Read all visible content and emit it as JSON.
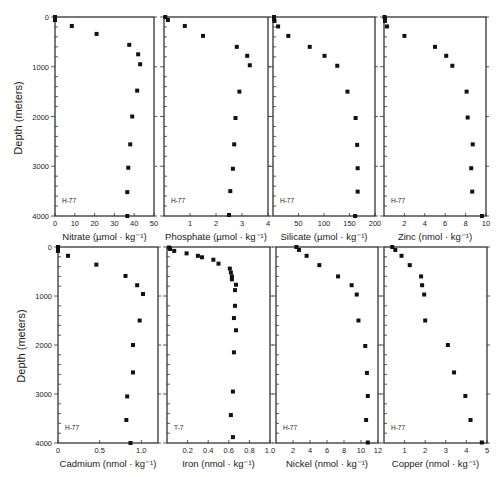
{
  "figure": {
    "ylabel": "Depth (meters)",
    "y_ticks": [
      0,
      1000,
      2000,
      3000,
      4000
    ],
    "y_tick_labels": [
      "0",
      "1000",
      "2000",
      "3000",
      "4000"
    ]
  },
  "chart_data": [
    {
      "type": "scatter",
      "title": "",
      "xlabel": "Nitrate (µmol · kg⁻¹)",
      "ylabel": "Depth (meters)",
      "station": "H-77",
      "xlim": [
        0,
        50
      ],
      "ylim": [
        4000,
        0
      ],
      "x_ticks": [
        0,
        10,
        20,
        30,
        40,
        50
      ],
      "x_tick_labels": [
        "0",
        "10",
        "20",
        "30",
        "40",
        "50"
      ],
      "points": [
        [
          0,
          0
        ],
        [
          0,
          30
        ],
        [
          0,
          60
        ],
        [
          8.5,
          180
        ],
        [
          21,
          340
        ],
        [
          37.5,
          560
        ],
        [
          42,
          750
        ],
        [
          43,
          950
        ],
        [
          41.5,
          1480
        ],
        [
          39,
          2000
        ],
        [
          38,
          2560
        ],
        [
          37,
          3030
        ],
        [
          36.5,
          3520
        ],
        [
          36.5,
          4000
        ]
      ]
    },
    {
      "type": "scatter",
      "title": "",
      "xlabel": "Phosphate (µmol · kg⁻¹)",
      "ylabel": "Depth (meters)",
      "station": "H-77",
      "xlim": [
        0,
        4
      ],
      "ylim": [
        4000,
        0
      ],
      "x_ticks": [
        1,
        2,
        3,
        4
      ],
      "x_tick_labels": [
        "1",
        "2",
        "3",
        "4"
      ],
      "points": [
        [
          0.05,
          0
        ],
        [
          0.15,
          60
        ],
        [
          0.8,
          180
        ],
        [
          1.5,
          380
        ],
        [
          2.8,
          600
        ],
        [
          3.2,
          780
        ],
        [
          3.3,
          970
        ],
        [
          2.9,
          1500
        ],
        [
          2.75,
          2030
        ],
        [
          2.7,
          2560
        ],
        [
          2.65,
          3050
        ],
        [
          2.55,
          3500
        ],
        [
          2.5,
          3980
        ]
      ]
    },
    {
      "type": "scatter",
      "title": "",
      "xlabel": "Silicate (µmol · kg⁻¹)",
      "ylabel": "Depth (meters)",
      "station": "H-77",
      "xlim": [
        0,
        200
      ],
      "ylim": [
        4000,
        0
      ],
      "x_ticks": [
        50,
        100,
        150,
        200
      ],
      "x_tick_labels": [
        "50",
        "100",
        "150",
        "200"
      ],
      "points": [
        [
          2,
          0
        ],
        [
          2,
          40
        ],
        [
          3,
          80
        ],
        [
          10,
          190
        ],
        [
          30,
          380
        ],
        [
          72,
          600
        ],
        [
          101,
          780
        ],
        [
          126,
          980
        ],
        [
          146,
          1500
        ],
        [
          162,
          2030
        ],
        [
          165,
          2570
        ],
        [
          166,
          3040
        ],
        [
          166,
          3510
        ],
        [
          161,
          4000
        ]
      ]
    },
    {
      "type": "scatter",
      "title": "",
      "xlabel": "Zinc (nmol · kg⁻¹)",
      "ylabel": "Depth (meters)",
      "station": "H-77",
      "xlim": [
        0,
        10
      ],
      "ylim": [
        4000,
        0
      ],
      "x_ticks": [
        2,
        4,
        6,
        8,
        10
      ],
      "x_tick_labels": [
        "2",
        "4",
        "6",
        "8",
        "10"
      ],
      "points": [
        [
          0.05,
          0
        ],
        [
          0.1,
          40
        ],
        [
          0.1,
          80
        ],
        [
          0.3,
          190
        ],
        [
          2,
          380
        ],
        [
          5,
          600
        ],
        [
          6.1,
          780
        ],
        [
          6.7,
          980
        ],
        [
          8.1,
          1500
        ],
        [
          8.2,
          2020
        ],
        [
          8.7,
          2560
        ],
        [
          8.55,
          3040
        ],
        [
          8.65,
          3510
        ],
        [
          9.6,
          4000
        ]
      ]
    },
    {
      "type": "scatter",
      "title": "",
      "xlabel": "Cadmium (nmol · kg⁻¹)",
      "ylabel": "Depth (meters)",
      "station": "H-77",
      "xlim": [
        0,
        1.2
      ],
      "ylim": [
        4000,
        0
      ],
      "x_ticks": [
        0,
        0.5,
        1.0
      ],
      "x_tick_labels": [
        "0",
        "0.5",
        "1.0"
      ],
      "points": [
        [
          0,
          0
        ],
        [
          0,
          40
        ],
        [
          0,
          80
        ],
        [
          0.12,
          180
        ],
        [
          0.46,
          360
        ],
        [
          0.81,
          590
        ],
        [
          0.95,
          780
        ],
        [
          1.02,
          960
        ],
        [
          0.98,
          1500
        ],
        [
          0.9,
          2000
        ],
        [
          0.9,
          2560
        ],
        [
          0.83,
          3050
        ],
        [
          0.82,
          3530
        ],
        [
          0.87,
          4000
        ]
      ]
    },
    {
      "type": "scatter",
      "title": "",
      "xlabel": "Iron (nmol · kg⁻¹)",
      "ylabel": "Depth (meters)",
      "station": "T-7",
      "xlim": [
        0,
        1.0
      ],
      "ylim": [
        4000,
        0
      ],
      "x_ticks": [
        0.2,
        0.4,
        0.6,
        0.8,
        1.0
      ],
      "x_tick_labels": [
        "0.2",
        "0.4",
        "0.6",
        "0.8",
        "1.0"
      ],
      "points": [
        [
          0.02,
          10
        ],
        [
          0.03,
          40
        ],
        [
          0.07,
          80
        ],
        [
          0.19,
          130
        ],
        [
          0.3,
          180
        ],
        [
          0.34,
          210
        ],
        [
          0.45,
          260
        ],
        [
          0.5,
          340
        ],
        [
          0.61,
          440
        ],
        [
          0.62,
          520
        ],
        [
          0.63,
          600
        ],
        [
          0.63,
          660
        ],
        [
          0.67,
          770
        ],
        [
          0.66,
          880
        ],
        [
          0.66,
          1200
        ],
        [
          0.65,
          1450
        ],
        [
          0.67,
          1700
        ],
        [
          0.65,
          2150
        ],
        [
          0.64,
          2950
        ],
        [
          0.62,
          3430
        ],
        [
          0.64,
          3880
        ]
      ]
    },
    {
      "type": "scatter",
      "title": "",
      "xlabel": "Nickel (nmol · kg⁻¹)",
      "ylabel": "Depth (meters)",
      "station": "H-77",
      "xlim": [
        0,
        12
      ],
      "ylim": [
        4000,
        0
      ],
      "x_ticks": [
        2,
        4,
        6,
        8,
        10,
        12
      ],
      "x_tick_labels": [
        "2",
        "4",
        "6",
        "8",
        "10",
        "12"
      ],
      "points": [
        [
          2.4,
          0
        ],
        [
          2.7,
          60
        ],
        [
          3.6,
          180
        ],
        [
          5.1,
          370
        ],
        [
          7.3,
          600
        ],
        [
          8.9,
          780
        ],
        [
          9.5,
          970
        ],
        [
          9.7,
          1500
        ],
        [
          10.5,
          2020
        ],
        [
          10.7,
          2570
        ],
        [
          10.8,
          3040
        ],
        [
          10.6,
          3530
        ],
        [
          10.8,
          3990
        ]
      ]
    },
    {
      "type": "scatter",
      "title": "",
      "xlabel": "Copper (nmol · kg⁻¹)",
      "ylabel": "Depth (meters)",
      "station": "H-77",
      "xlim": [
        0,
        5
      ],
      "ylim": [
        4000,
        0
      ],
      "x_ticks": [
        1,
        2,
        3,
        4,
        5
      ],
      "x_tick_labels": [
        "1",
        "2",
        "3",
        "4",
        "5"
      ],
      "points": [
        [
          0.4,
          0
        ],
        [
          0.55,
          60
        ],
        [
          0.85,
          180
        ],
        [
          1.25,
          370
        ],
        [
          1.8,
          600
        ],
        [
          1.85,
          780
        ],
        [
          1.95,
          970
        ],
        [
          2.0,
          1500
        ],
        [
          3.1,
          2000
        ],
        [
          3.4,
          2560
        ],
        [
          3.95,
          3040
        ],
        [
          4.2,
          3530
        ],
        [
          4.75,
          3990
        ]
      ]
    }
  ]
}
